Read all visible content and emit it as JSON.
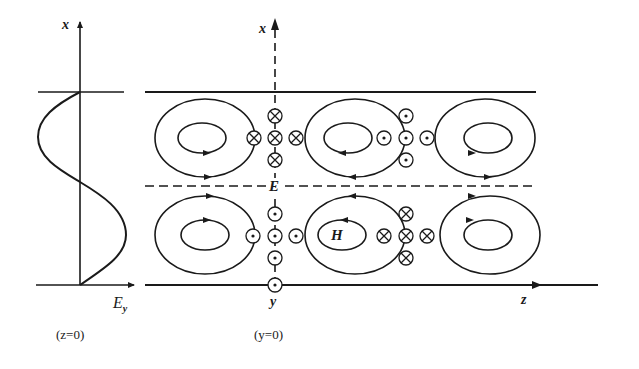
{
  "figure": {
    "left_panel": {
      "axis_label": "x",
      "curve_label": "E",
      "curve_label_sub": "y",
      "caption": "(z=0)"
    },
    "right_panel": {
      "vertical_axis_label": "x",
      "horizontal_axis_label": "z",
      "center_bottom_label": "y",
      "midline_label": "E",
      "field_label": "H",
      "caption": "(y=0)"
    },
    "symbols": {
      "into_page": "⊗",
      "out_of_page": "⊙"
    }
  }
}
